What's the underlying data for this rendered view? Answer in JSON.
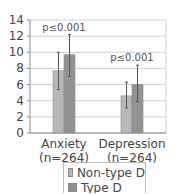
{
  "chart_data": {
    "type": "bar",
    "title": "",
    "xlabel": "",
    "ylabel": "",
    "ylim": [
      0,
      14
    ],
    "yticks": [
      0,
      2,
      4,
      6,
      8,
      10,
      12,
      14
    ],
    "grid": true,
    "legend_position": "bottom",
    "categories": [
      "Anxiety\n(n=264)",
      "Depression\n(n=264)"
    ],
    "category_labels": [
      {
        "line1": "Anxiety",
        "line2": "(n=264)"
      },
      {
        "line1": "Depression",
        "line2": "(n=264)"
      }
    ],
    "series": [
      {
        "name": "Non-type D",
        "color": "#b8b8b8",
        "values": [
          7.7,
          4.6
        ],
        "error_upper": [
          10.0,
          6.3
        ],
        "error_lower": [
          5.4,
          3.1
        ]
      },
      {
        "name": "Type D",
        "color": "#939393",
        "values": [
          9.7,
          6.0
        ],
        "error_upper": [
          12.2,
          8.4
        ],
        "error_lower": [
          7.0,
          3.9
        ]
      }
    ],
    "annotations": [
      {
        "category": 0,
        "text": "p≤0.001"
      },
      {
        "category": 1,
        "text": "p≤0.001"
      }
    ]
  },
  "legend": {
    "items": [
      {
        "label": "Non-type D",
        "color": "#b8b8b8"
      },
      {
        "label": "Type D",
        "color": "#939393"
      }
    ]
  }
}
